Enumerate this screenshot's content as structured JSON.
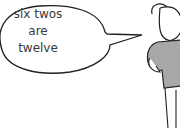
{
  "speech_bubble": {
    "lines": [
      "six twos",
      "are",
      "twelve"
    ]
  },
  "character": {
    "type": "cartoon-pig",
    "shirt_color": "#9a9a9a"
  }
}
